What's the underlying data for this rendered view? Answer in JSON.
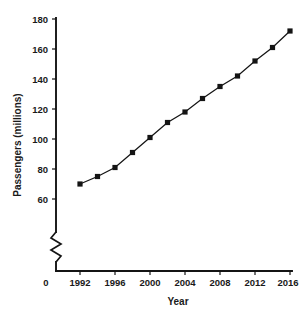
{
  "chart_data": {
    "type": "line",
    "title": "",
    "xlabel": "Year",
    "ylabel": "Passengers (millions)",
    "x": [
      1992,
      1994,
      1996,
      1998,
      2000,
      2002,
      2004,
      2006,
      2008,
      2010,
      2012,
      2014,
      2016
    ],
    "values": [
      70,
      75,
      81,
      91,
      101,
      111,
      118,
      127,
      135,
      142,
      152,
      161,
      172
    ],
    "series": [
      {
        "name": "Passengers",
        "values": [
          70,
          75,
          81,
          91,
          101,
          111,
          118,
          127,
          135,
          142,
          152,
          161,
          172
        ]
      }
    ],
    "xlim": [
      1991,
      2017
    ],
    "ylim": [
      55,
      182
    ],
    "xticks": [
      1992,
      1996,
      2000,
      2004,
      2008,
      2012,
      2016
    ],
    "xtick_labels": [
      "1992",
      "1996",
      "2000",
      "2004",
      "2008",
      "2012",
      "2016"
    ],
    "yticks": [
      60,
      80,
      100,
      120,
      140,
      160,
      180
    ],
    "ytick_labels": [
      "60",
      "80",
      "100",
      "120",
      "140",
      "160",
      "180"
    ],
    "origin_label": "0",
    "axis_break": true,
    "axis_break_axis": "y",
    "grid": false,
    "legend": false,
    "marker": "square",
    "line_color": "#141414",
    "marker_color": "#141414"
  },
  "caption": {
    "text": "Passengers have made frequent of services in the Southern air"
  }
}
